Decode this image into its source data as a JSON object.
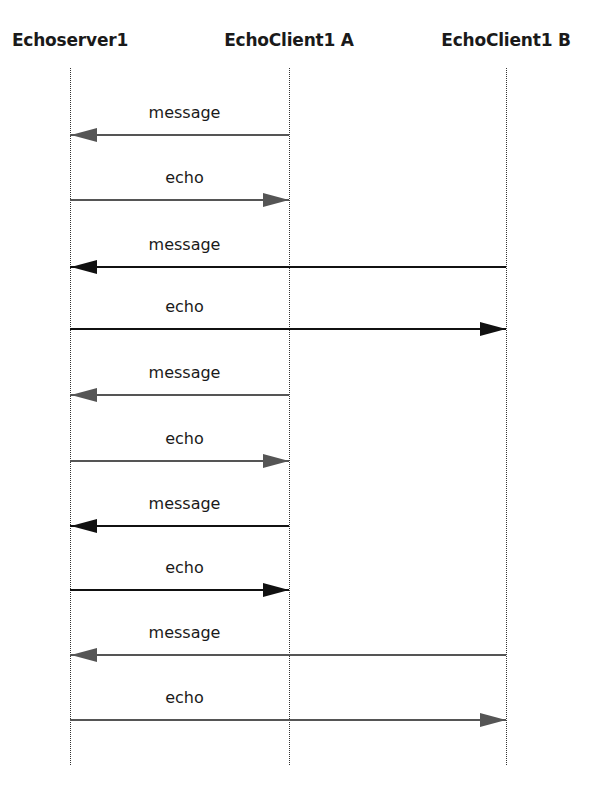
{
  "diagram": {
    "type": "sequence",
    "participants": [
      {
        "id": "server",
        "label": "Echoserver1",
        "x": 70
      },
      {
        "id": "clientA",
        "label": "EchoClient1 A",
        "x": 289
      },
      {
        "id": "clientB",
        "label": "EchoClient1 B",
        "x": 506
      }
    ],
    "lifeline": {
      "top": 68,
      "bottom": 765
    },
    "messages": [
      {
        "label": "message",
        "from": "clientA",
        "to": "server",
        "y": 134,
        "color": "#555555"
      },
      {
        "label": "echo",
        "from": "server",
        "to": "clientA",
        "y": 199,
        "color": "#555555"
      },
      {
        "label": "message",
        "from": "clientB",
        "to": "server",
        "y": 266,
        "color": "#111111"
      },
      {
        "label": "echo",
        "from": "server",
        "to": "clientB",
        "y": 328,
        "color": "#111111"
      },
      {
        "label": "message",
        "from": "clientA",
        "to": "server",
        "y": 394,
        "color": "#555555"
      },
      {
        "label": "echo",
        "from": "server",
        "to": "clientA",
        "y": 460,
        "color": "#555555"
      },
      {
        "label": "message",
        "from": "clientA",
        "to": "server",
        "y": 525,
        "color": "#111111"
      },
      {
        "label": "echo",
        "from": "server",
        "to": "clientA",
        "y": 589,
        "color": "#111111"
      },
      {
        "label": "message",
        "from": "clientB",
        "to": "server",
        "y": 654,
        "color": "#555555"
      },
      {
        "label": "echo",
        "from": "server",
        "to": "clientB",
        "y": 719,
        "color": "#555555"
      }
    ]
  }
}
